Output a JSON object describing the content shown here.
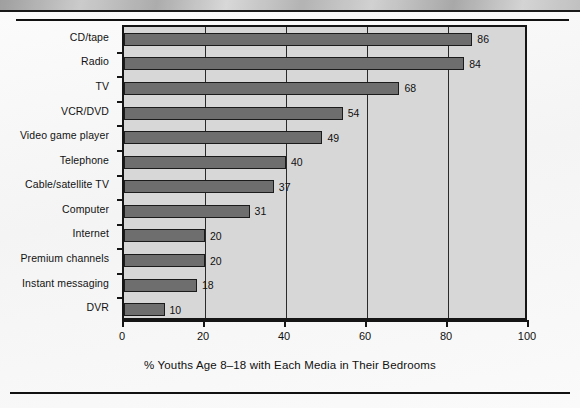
{
  "figure": {
    "x_axis_title": "% Youths Age 8–18 with Each Media in Their Bedrooms"
  },
  "colors": {
    "bar_fill": "#6e6e6e",
    "bar_edge": "#1b1b1b",
    "plot_background": "#d7d7d7",
    "axis": "#151515",
    "gridline": "#2a2a2a",
    "text": "#101010",
    "page_background": "#ffffff"
  },
  "chart_data": {
    "type": "bar",
    "orientation": "horizontal",
    "title": "",
    "subtitle": "",
    "xlabel": "% Youths Age 8–18 with Each Media in Their Bedrooms",
    "ylabel": "",
    "xlim": [
      0,
      100
    ],
    "xticks": [
      0,
      20,
      40,
      60,
      80,
      100
    ],
    "xtick_labels": [
      "0",
      "20",
      "40",
      "60",
      "80",
      "100"
    ],
    "grid": "vertical",
    "legend": "none",
    "data_labels": true,
    "categories": [
      "CD/tape",
      "Radio",
      "TV",
      "VCR/DVD",
      "Video game player",
      "Telephone",
      "Cable/satellite TV",
      "Computer",
      "Internet",
      "Premium channels",
      "Instant messaging",
      "DVR"
    ],
    "values": [
      86,
      84,
      68,
      54,
      49,
      40,
      37,
      31,
      20,
      20,
      18,
      10
    ],
    "value_labels": [
      "86",
      "84",
      "68",
      "54",
      "49",
      "40",
      "37",
      "31",
      "20",
      "20",
      "18",
      "10"
    ]
  }
}
